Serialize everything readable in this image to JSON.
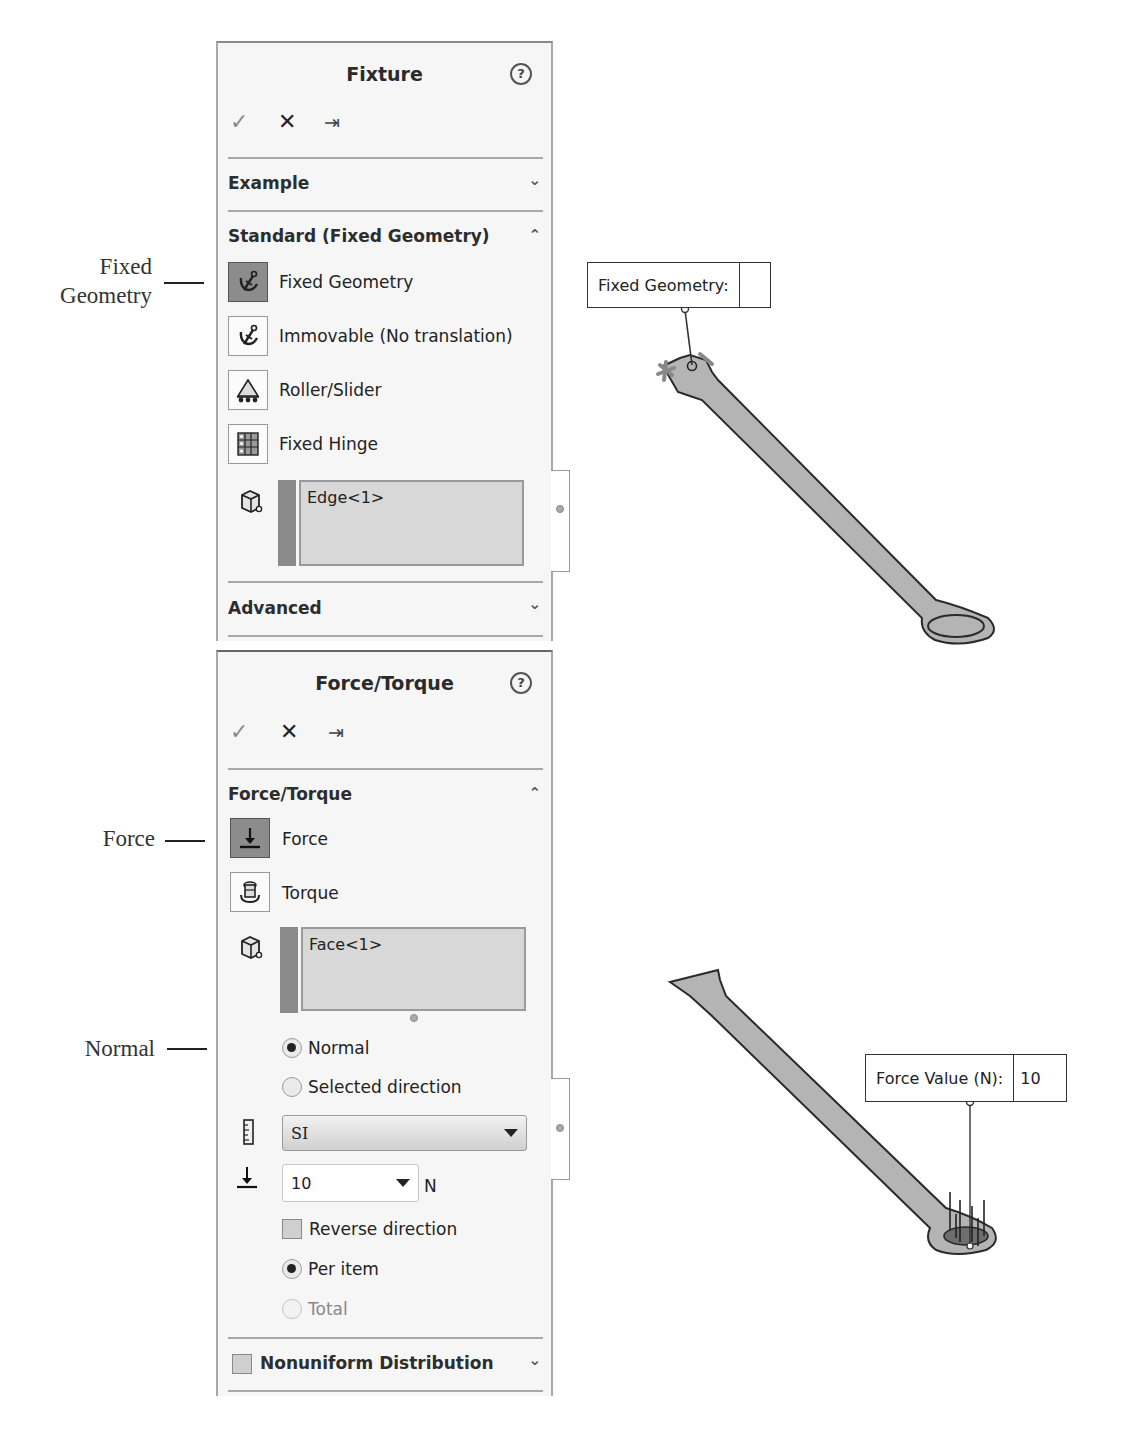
{
  "annotations": {
    "fixed_geometry": "Fixed\nGeometry",
    "force": "Force",
    "normal": "Normal"
  },
  "fixture_panel": {
    "title": "Fixture",
    "help_icon": "?",
    "toolbar": {
      "ok": "✓",
      "cancel": "✕",
      "pin": "⇥"
    },
    "sections": {
      "example": "Example",
      "standard": "Standard (Fixed Geometry)",
      "advanced": "Advanced"
    },
    "options": [
      {
        "label": "Fixed Geometry",
        "icon": "anchor-icon",
        "active": true
      },
      {
        "label": "Immovable (No translation)",
        "icon": "anchor-icon",
        "active": false
      },
      {
        "label": "Roller/Slider",
        "icon": "roller-icon",
        "active": false
      },
      {
        "label": "Fixed Hinge",
        "icon": "hinge-icon",
        "active": false
      }
    ],
    "selection": "Edge<1>"
  },
  "force_panel": {
    "title": "Force/Torque",
    "help_icon": "?",
    "toolbar": {
      "ok": "✓",
      "cancel": "✕",
      "pin": "⇥"
    },
    "section": "Force/Torque",
    "options": [
      {
        "label": "Force",
        "icon": "force-arrow-icon",
        "active": true
      },
      {
        "label": "Torque",
        "icon": "torque-icon",
        "active": false
      }
    ],
    "selection": "Face<1>",
    "direction": {
      "normal": "Normal",
      "selected": "Selected direction",
      "selected_value": "Normal"
    },
    "units": {
      "value": "SI"
    },
    "force_value": {
      "value": "10",
      "unit": "N"
    },
    "reverse_direction": {
      "label": "Reverse direction",
      "checked": false
    },
    "distribution": {
      "per_item": "Per item",
      "total": "Total",
      "selected_value": "Per item"
    },
    "nonuniform": {
      "label": "Nonuniform Distribution",
      "checked": false
    }
  },
  "viewport": {
    "fixed_callout": {
      "label": "Fixed Geometry:",
      "value": ""
    },
    "force_callout": {
      "label": "Force Value (N):",
      "value": "10"
    }
  },
  "colors": {
    "panel_bg": "#f6f6f6",
    "active_button": "#8c8c8c",
    "part_fill": "#b4b4b4",
    "selection_box": "#d8d8d8"
  }
}
